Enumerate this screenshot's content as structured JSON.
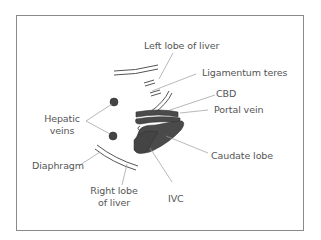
{
  "diagram": {
    "type": "anatomical-labelled-diagram",
    "labels": {
      "left_lobe": "Left lobe of liver",
      "ligamentum_teres": "Ligamentum teres",
      "cbd": "CBD",
      "portal_vein": "Portal vein",
      "hepatic_veins_line1": "Hepatic",
      "hepatic_veins_line2": "veins",
      "caudate_lobe": "Caudate lobe",
      "diaphragm": "Diaphragm",
      "right_lobe_line1": "Right lobe",
      "right_lobe_line2": "of liver",
      "ivc": "IVC"
    },
    "colors": {
      "frame": "#8a8a8a",
      "leader_line": "#9a9a9a",
      "structure_fill": "#4a4a4a",
      "structure_stroke": "#333333",
      "text": "#555555"
    }
  }
}
